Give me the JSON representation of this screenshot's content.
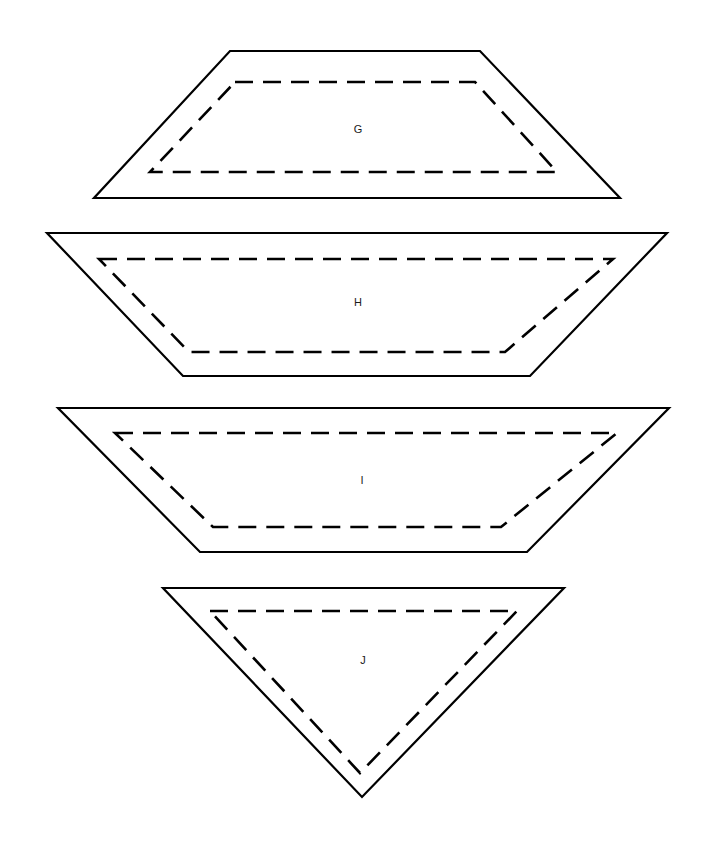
{
  "figure": {
    "background_color": "#ffffff",
    "stroke_color": "#000000",
    "label_color": "#1a1a1a",
    "width": 705,
    "height": 849
  },
  "chart_data": {
    "type": "diagram",
    "title": "",
    "shapes": [
      {
        "label": "G",
        "kind": "trapezoid",
        "orientation": "narrow-top-wide-bottom",
        "outline_points": "230,51 480,51 620,198 94,198",
        "dashed_points": "235,82 475,82 557,172 150,172",
        "label_x": 358,
        "label_y": 130
      },
      {
        "label": "H",
        "kind": "trapezoid",
        "orientation": "wide-top-narrow-bottom",
        "outline_points": "47,233 667,233 530,376 183,376",
        "dashed_points": "99,259 613,259 505,352 189,352",
        "label_x": 358,
        "label_y": 303
      },
      {
        "label": "I",
        "kind": "trapezoid",
        "orientation": "wide-top-narrow-bottom",
        "outline_points": "58,408 669,408 527,552 200,552",
        "dashed_points": "115,433 617,433 501,527 213,527",
        "label_x": 362,
        "label_y": 481
      },
      {
        "label": "J",
        "kind": "triangle",
        "orientation": "inverted-apex-bottom",
        "outline_points": "163,588 564,588 362,797",
        "dashed_points": "210,611 517,611 360,773",
        "label_x": 363,
        "label_y": 661
      }
    ],
    "labels": [
      "G",
      "H",
      "I",
      "J"
    ],
    "line_style": {
      "outline": "solid",
      "inner": "dashed",
      "dash_length": 18,
      "gap_length": 10,
      "stroke_width": 2.2
    }
  }
}
